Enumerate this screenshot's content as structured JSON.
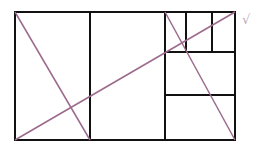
{
  "diagram": {
    "stroke_color": "#111111",
    "diagonal_color": "#9b6a8c",
    "mark_color": "#bbaabb",
    "outer_rect": {
      "x": 15,
      "y": 12,
      "w": 220,
      "h": 128
    },
    "lines": [
      {
        "x1": 90,
        "y1": 12,
        "x2": 90,
        "y2": 140
      },
      {
        "x1": 165,
        "y1": 12,
        "x2": 165,
        "y2": 140
      },
      {
        "x1": 165,
        "y1": 52,
        "x2": 235,
        "y2": 52
      },
      {
        "x1": 165,
        "y1": 95,
        "x2": 235,
        "y2": 95
      },
      {
        "x1": 186,
        "y1": 12,
        "x2": 186,
        "y2": 52
      },
      {
        "x1": 212,
        "y1": 12,
        "x2": 212,
        "y2": 52
      }
    ],
    "diagonals": [
      {
        "x1": 15,
        "y1": 12,
        "x2": 90,
        "y2": 140
      },
      {
        "x1": 15,
        "y1": 140,
        "x2": 235,
        "y2": 12
      },
      {
        "x1": 165,
        "y1": 12,
        "x2": 235,
        "y2": 140
      }
    ],
    "mark": "√"
  }
}
